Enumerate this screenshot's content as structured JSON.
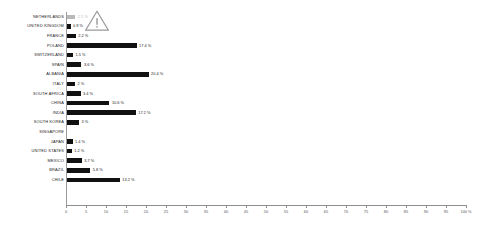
{
  "chart_data": {
    "type": "bar",
    "orientation": "horizontal",
    "title": "",
    "subtitle": "",
    "xlabel": "",
    "ylabel": "",
    "xlim": [
      0,
      100
    ],
    "grid": false,
    "legend": null,
    "unit": "%",
    "tick_labels": [
      "0",
      "5",
      "10",
      "15",
      "20",
      "25",
      "30",
      "35",
      "40",
      "45",
      "50",
      "55",
      "60",
      "65",
      "70",
      "75",
      "80",
      "85",
      "90",
      "95",
      "100 %"
    ],
    "tick_values": [
      0,
      5,
      10,
      15,
      20,
      25,
      30,
      35,
      40,
      45,
      50,
      55,
      60,
      65,
      70,
      75,
      80,
      85,
      90,
      95,
      100
    ],
    "categories": [
      "NETHERLANDS",
      "UNITED KINGDOM",
      "FRANCE",
      "POLAND",
      "SWITZERLAND",
      "SPAIN",
      "ALBANIA",
      "ITALY",
      "SOUTH AFRICA",
      "CHINA",
      "INDIA",
      "SOUTH KOREA",
      "SINGAPORE",
      "JAPAN",
      "UNITED STATES",
      "MEXICO",
      "BRAZIL",
      "CHILE"
    ],
    "values": [
      2.1,
      0.9,
      2.2,
      17.4,
      1.5,
      3.6,
      20.4,
      2.0,
      3.4,
      10.6,
      17.2,
      3.0,
      0.0,
      1.4,
      1.2,
      3.7,
      5.8,
      13.2
    ],
    "value_labels": [
      "2.1 %",
      "0.9 %",
      "2.2 %",
      "17.4 %",
      "1.5 %",
      "3.6 %",
      "20.4 %",
      "2 %",
      "3.4 %",
      "10.6 %",
      "17.2 %",
      "3 %",
      "",
      "1.4 %",
      "1.2 %",
      "3.7 %",
      "5.8 %",
      "13.2 %"
    ],
    "bar_styles": [
      "muted",
      "solid",
      "solid",
      "solid",
      "solid",
      "solid",
      "solid",
      "solid",
      "solid",
      "solid",
      "solid",
      "solid",
      "solid",
      "solid",
      "solid",
      "solid",
      "solid",
      "solid"
    ],
    "colors": {
      "bar": "#111111",
      "bar_muted": "#b9b9b9",
      "axis": "#8d8d8d",
      "text": "#1c1c1c",
      "tick_text": "#575757",
      "warning": "#9a9a9a",
      "background": "#ffffff"
    }
  },
  "annotations": {
    "warning_icon": "warning-triangle-icon"
  }
}
